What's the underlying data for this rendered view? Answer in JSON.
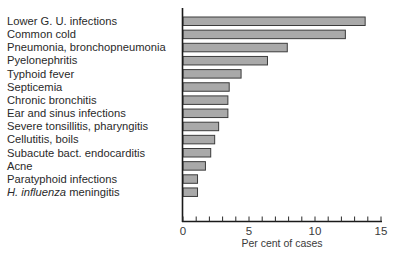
{
  "chart_data": {
    "type": "bar",
    "orientation": "horizontal",
    "title": "",
    "xlabel": "Per cent of cases",
    "ylabel": "",
    "xlim": [
      0,
      15
    ],
    "xticks": [
      0,
      5,
      10,
      15
    ],
    "minor_tick_step": 1,
    "grid": false,
    "categories": [
      "Lower G. U. infections",
      "Common cold",
      "Pneumonia, bronchopneumonia",
      "Pyelonephritis",
      "Typhoid fever",
      "Septicemia",
      "Chronic bronchitis",
      "Ear and sinus infections",
      "Severe tonsillitis, pharyngitis",
      "Cellutitis, boils",
      "Subacute bact. endocarditis",
      "Acne",
      "Paratyphoid infections",
      "H. influenza meningitis"
    ],
    "category_parts": [
      [
        {
          "t": "Lower G. U. infections",
          "i": false
        }
      ],
      [
        {
          "t": "Common cold",
          "i": false
        }
      ],
      [
        {
          "t": "Pneumonia, bronchopneumonia",
          "i": false
        }
      ],
      [
        {
          "t": "Pyelonephritis",
          "i": false
        }
      ],
      [
        {
          "t": "Typhoid fever",
          "i": false
        }
      ],
      [
        {
          "t": "Septicemia",
          "i": false
        }
      ],
      [
        {
          "t": "Chronic bronchitis",
          "i": false
        }
      ],
      [
        {
          "t": "Ear and sinus infections",
          "i": false
        }
      ],
      [
        {
          "t": "Severe tonsillitis, pharyngitis",
          "i": false
        }
      ],
      [
        {
          "t": "Cellutitis, boils",
          "i": false
        }
      ],
      [
        {
          "t": "Subacute bact. endocarditis",
          "i": false
        }
      ],
      [
        {
          "t": "Acne",
          "i": false
        }
      ],
      [
        {
          "t": "Paratyphoid infections",
          "i": false
        }
      ],
      [
        {
          "t": "H. influenza",
          "i": true
        },
        {
          "t": " meningitis",
          "i": false
        }
      ]
    ],
    "values": [
      13.8,
      12.3,
      7.9,
      6.4,
      4.4,
      3.5,
      3.4,
      3.4,
      2.7,
      2.4,
      2.1,
      1.7,
      1.1,
      1.1
    ],
    "bar_color": "#a9a9a9",
    "bar_edge_color": "#3c3c3c"
  }
}
